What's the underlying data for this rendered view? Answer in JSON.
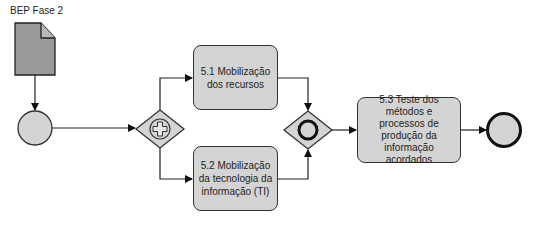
{
  "diagram": {
    "type": "BPMN process",
    "data_object": {
      "label": "BEP Fase 2"
    },
    "start_event": {
      "label": ""
    },
    "split_gateway": {
      "type": "parallel",
      "symbol": "plus"
    },
    "tasks": [
      {
        "id": "5.1",
        "label": "5.1 Mobilização dos recursos"
      },
      {
        "id": "5.2",
        "label": "5.2 Mobilização da tecnologia da informação (TI)"
      },
      {
        "id": "5.3",
        "label": "5.3 Teste dos métodos e processos de produção da informação acordados"
      }
    ],
    "merge_gateway": {
      "type": "inclusive",
      "symbol": "circle"
    },
    "end_event": {
      "label": ""
    },
    "flows": [
      {
        "from": "BEP Fase 2",
        "to": "start_event"
      },
      {
        "from": "start_event",
        "to": "split_gateway"
      },
      {
        "from": "split_gateway",
        "to": "5.1"
      },
      {
        "from": "split_gateway",
        "to": "5.2"
      },
      {
        "from": "5.1",
        "to": "merge_gateway"
      },
      {
        "from": "5.2",
        "to": "merge_gateway"
      },
      {
        "from": "merge_gateway",
        "to": "5.3"
      },
      {
        "from": "5.3",
        "to": "end_event"
      }
    ],
    "colors": {
      "fill": "#d4d4d4",
      "doc_fill": "#9a9a9a",
      "stroke": "#222222"
    }
  }
}
